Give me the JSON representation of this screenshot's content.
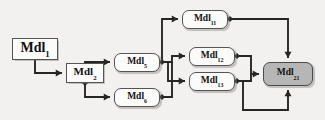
{
  "figure": {
    "kind": "block-diagram",
    "background_color": "#f2f1ef",
    "line_color": "#262626",
    "node_fill": "#fbfbfa",
    "node_stroke": "#545454",
    "highlight_fill": "#b6b6b6",
    "scan_artifact_text": "bleed-through"
  },
  "nodes": [
    {
      "id": "mdl1",
      "base": "Mdl",
      "sub": "1",
      "shape": "rect",
      "shaded": false,
      "x": 12,
      "y": 38,
      "w": 46,
      "h": 22,
      "size": "sz-big"
    },
    {
      "id": "mdl2",
      "base": "Mdl",
      "sub": "2",
      "shape": "rect",
      "shaded": false,
      "x": 66,
      "y": 63,
      "w": 38,
      "h": 20,
      "size": "sz-mid"
    },
    {
      "id": "mdl5",
      "base": "Mdl",
      "sub": "5",
      "shape": "round",
      "shaded": false,
      "x": 114,
      "y": 53,
      "w": 46,
      "h": 19,
      "size": "sz-sm"
    },
    {
      "id": "mdl6",
      "base": "Mdl",
      "sub": "6",
      "shape": "round",
      "shaded": false,
      "x": 114,
      "y": 88,
      "w": 46,
      "h": 19,
      "size": "sz-sm"
    },
    {
      "id": "mdl11",
      "base": "Mdl",
      "sub": "11",
      "shape": "round",
      "shaded": false,
      "x": 182,
      "y": 10,
      "w": 46,
      "h": 19,
      "size": "sz-sm"
    },
    {
      "id": "mdl12",
      "base": "Mdl",
      "sub": "12",
      "shape": "round",
      "shaded": false,
      "x": 189,
      "y": 47,
      "w": 46,
      "h": 19,
      "size": "sz-sm"
    },
    {
      "id": "mdl13",
      "base": "Mdl",
      "sub": "13",
      "shape": "round",
      "shaded": false,
      "x": 189,
      "y": 72,
      "w": 46,
      "h": 19,
      "size": "sz-sm"
    },
    {
      "id": "mdl21",
      "base": "Mdl",
      "sub": "21",
      "shape": "round",
      "shaded": true,
      "x": 263,
      "y": 62,
      "w": 50,
      "h": 24,
      "size": "sz-sm"
    }
  ],
  "junction_dots": [
    {
      "id": "dot-mdl2-out",
      "x": 85,
      "y": 83
    },
    {
      "id": "dot-mdl5-out",
      "x": 162,
      "y": 62
    },
    {
      "id": "dot-mdl6-out",
      "x": 162,
      "y": 97
    },
    {
      "id": "dot-mdl11-out",
      "x": 230,
      "y": 19
    },
    {
      "id": "dot-mdl12-out",
      "x": 237,
      "y": 56
    },
    {
      "id": "dot-mdl13-out",
      "x": 237,
      "y": 81
    }
  ],
  "edges": [
    {
      "id": "e-mdl1-mdl2",
      "from": "mdl1",
      "to": "mdl2",
      "path": "M 35 60 L 35 73 L 62 73",
      "arrow": "right",
      "ax": 62,
      "ay": 73
    },
    {
      "id": "e-mdl2-mdl5",
      "from": "mdl2",
      "to": "mdl5",
      "path": "M 85 83 L 85 62 L 110 62",
      "arrow": "right",
      "ax": 110,
      "ay": 62
    },
    {
      "id": "e-mdl2-mdl6",
      "from": "mdl2",
      "to": "mdl6",
      "path": "M 85 83 L 85 97 L 110 97",
      "arrow": "right",
      "ax": 110,
      "ay": 97
    },
    {
      "id": "e-mdl5-mdl11",
      "from": "mdl5",
      "to": "mdl11",
      "path": "M 162 62 L 162 19 L 178 19",
      "arrow": "right",
      "ax": 178,
      "ay": 19
    },
    {
      "id": "e-mdl5-mdl12",
      "from": "mdl5",
      "to": "mdl12",
      "path": "M 162 62 L 172 62 L 172 56 L 185 56",
      "arrow": "right",
      "ax": 185,
      "ay": 56
    },
    {
      "id": "e-mdl5-mdl13",
      "from": "mdl5",
      "to": "mdl13",
      "path": "M 168 62 L 168 81 L 185 81",
      "arrow": "right",
      "ax": 185,
      "ay": 81
    },
    {
      "id": "e-mdl6-mdl12",
      "from": "mdl6",
      "to": "mdl12",
      "path": "M 162 97 L 172 97 L 172 62",
      "arrow": "none",
      "ax": 0,
      "ay": 0
    },
    {
      "id": "e-mdl11-mdl21",
      "from": "mdl11",
      "to": "mdl21",
      "path": "M 230 19 L 288 19 L 288 58",
      "arrow": "down",
      "ax": 288,
      "ay": 58
    },
    {
      "id": "e-mdl12-mdl21",
      "from": "mdl12",
      "to": "mdl21",
      "path": "M 237 56 L 251 56 L 251 74 L 259 74",
      "arrow": "right",
      "ax": 259,
      "ay": 74
    },
    {
      "id": "e-mdl13-mdl21",
      "from": "mdl13",
      "to": "mdl21",
      "path": "M 237 81 L 251 81 L 251 74",
      "arrow": "none",
      "ax": 0,
      "ay": 0
    },
    {
      "id": "e-mdl13-mdl21-bottom",
      "from": "mdl13",
      "to": "mdl21",
      "path": "M 243 81 L 243 110 L 288 110 L 288 90",
      "arrow": "up",
      "ax": 288,
      "ay": 90
    }
  ]
}
